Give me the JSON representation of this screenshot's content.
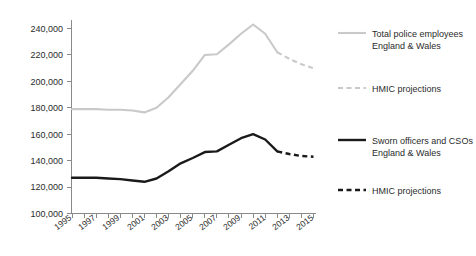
{
  "chart_data": {
    "type": "line",
    "title": "",
    "xlabel": "",
    "ylabel": "",
    "xlim": [
      1995,
      2015
    ],
    "ylim": [
      100000,
      240000
    ],
    "grid": false,
    "legend_position": "right",
    "x": [
      1995,
      1996,
      1997,
      1998,
      1999,
      2000,
      2001,
      2002,
      2003,
      2004,
      2005,
      2006,
      2007,
      2008,
      2009,
      2010,
      2011,
      2012,
      2013,
      2014,
      2015
    ],
    "y_ticks": [
      100000,
      120000,
      140000,
      160000,
      180000,
      200000,
      220000,
      240000
    ],
    "y_tick_labels": [
      "100,000",
      "120,000",
      "140,000",
      "160,000",
      "180,000",
      "200,000",
      "220,000",
      "240,000"
    ],
    "x_ticks": [
      1995,
      1997,
      1999,
      2001,
      2003,
      2005,
      2007,
      2009,
      2011,
      2013,
      2015
    ],
    "x_tick_labels": [
      "1995",
      "1997",
      "1999",
      "2001",
      "2003",
      "2005",
      "2007",
      "2009",
      "2011",
      "2013",
      "2015"
    ],
    "series": [
      {
        "name": "Total police employees England & Wales",
        "style": "solid",
        "color": "#c9c9c9",
        "x": [
          1995,
          1996,
          1997,
          1998,
          1999,
          2000,
          2001,
          2002,
          2003,
          2004,
          2005,
          2006,
          2007,
          2008,
          2009,
          2010,
          2011,
          2012
        ],
        "values": [
          179000,
          179000,
          179000,
          178500,
          178500,
          178000,
          176500,
          180000,
          188000,
          198000,
          208000,
          220000,
          220500,
          228000,
          236000,
          243000,
          236000,
          222000
        ]
      },
      {
        "name": "HMIC projections (total police employees)",
        "style": "dashed",
        "color": "#c9c9c9",
        "x": [
          2012,
          2013,
          2014,
          2015
        ],
        "values": [
          222000,
          217000,
          213000,
          210000
        ]
      },
      {
        "name": "Sworn officers and CSOs England & Wales",
        "style": "solid",
        "color": "#1a1a1a",
        "x": [
          1995,
          1996,
          1997,
          1998,
          1999,
          2000,
          2001,
          2002,
          2003,
          2004,
          2005,
          2006,
          2007,
          2008,
          2009,
          2010,
          2011,
          2012
        ],
        "values": [
          127000,
          127000,
          127000,
          126500,
          126000,
          125000,
          124000,
          126500,
          132000,
          138000,
          142000,
          146500,
          147000,
          152000,
          157000,
          160000,
          156000,
          147000
        ]
      },
      {
        "name": "HMIC projections (sworn officers and CSOs)",
        "style": "dashed",
        "color": "#1a1a1a",
        "x": [
          2012,
          2013,
          2014,
          2015
        ],
        "values": [
          147000,
          145000,
          143500,
          143000
        ]
      }
    ]
  },
  "legend": {
    "items": [
      {
        "label_line1": "Total police employees",
        "label_line2": "England & Wales",
        "swatch": "solid-gray-line",
        "color": "#c9c9c9"
      },
      {
        "label_line1": "HMIC projections",
        "label_line2": "",
        "swatch": "dashed-gray-line",
        "color": "#c9c9c9"
      },
      {
        "label_line1": "Sworn officers and CSOs",
        "label_line2": "England & Wales",
        "swatch": "solid-black-line",
        "color": "#1a1a1a"
      },
      {
        "label_line1": "HMIC  projections",
        "label_line2": "",
        "swatch": "dashed-black-line",
        "color": "#1a1a1a"
      }
    ]
  },
  "axes": {
    "axis_color": "#8a8a8a",
    "y_tick_labels": [
      "240,000",
      "220,000",
      "200,000",
      "180,000",
      "160,000",
      "140,000",
      "120,000",
      "100,000"
    ],
    "x_tick_labels": [
      "1995",
      "1997",
      "1999",
      "2001",
      "2003",
      "2005",
      "2007",
      "2009",
      "2011",
      "2013",
      "2015"
    ]
  }
}
